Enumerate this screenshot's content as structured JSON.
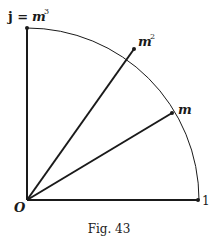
{
  "figure": {
    "caption": "Fig. 43",
    "colors": {
      "ink": "#1a1a1a",
      "background": "#ffffff"
    },
    "origin": {
      "label": "O",
      "x": 27,
      "y": 200
    },
    "radius": 172,
    "points": [
      {
        "id": "one",
        "label": "1",
        "angle_deg": 0
      },
      {
        "id": "m",
        "label": "m",
        "angle_deg": 30
      },
      {
        "id": "m2",
        "label": "m",
        "sup": "2",
        "angle_deg": 57
      },
      {
        "id": "j",
        "label_prefix": "j =",
        "label": "m",
        "sup": "3",
        "angle_deg": 90
      }
    ]
  }
}
